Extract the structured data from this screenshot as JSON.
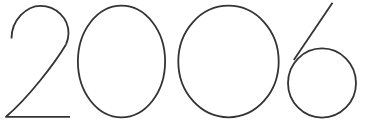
{
  "canvas": {
    "width": 366,
    "height": 127,
    "background_color": "#ffffff"
  },
  "artwork": {
    "name": "year-numerals",
    "text": "2006",
    "style_description": "thin geometric outline numerals",
    "stroke_color": "#333333",
    "stroke_width": 1.8,
    "fill": "none"
  },
  "glyphs": [
    {
      "character": "2",
      "name": "digit-two",
      "bbox": {
        "x": 5,
        "y": 5,
        "width": 65,
        "height": 113
      },
      "parts": [
        {
          "name": "two-top-arc",
          "type": "path",
          "d": "M 11.5 38.5 C 11.5 20.0 26.5 5.8 40.5 5.8 C 56.0 5.8 68.5 18.0 68.5 33.0 C 68.5 39.0 67.2 41.5 66.0 44.5"
        },
        {
          "name": "two-diagonal",
          "type": "path",
          "d": "M 66.0 44.5 C 55.0 63.0 28.0 98.0 6.5 116.2"
        },
        {
          "name": "two-baseline",
          "type": "path",
          "d": "M 5.2 116.8 L 70.0 116.8"
        }
      ]
    },
    {
      "character": "0",
      "name": "digit-zero-first",
      "bbox": {
        "x": 77,
        "y": 5,
        "width": 89,
        "height": 113
      },
      "parts": [
        {
          "name": "zero-first-ellipse",
          "type": "ellipse",
          "cx": 121.5,
          "cy": 61.5,
          "rx": 43.6,
          "ry": 55.8
        }
      ]
    },
    {
      "character": "0",
      "name": "digit-zero-second",
      "bbox": {
        "x": 178,
        "y": 5,
        "width": 101,
        "height": 113
      },
      "parts": [
        {
          "name": "zero-second-ellipse",
          "type": "ellipse",
          "cx": 228.5,
          "cy": 61.5,
          "rx": 50.2,
          "ry": 55.8
        }
      ]
    },
    {
      "character": "6",
      "name": "digit-six",
      "bbox": {
        "x": 288,
        "y": 3,
        "width": 69,
        "height": 115
      },
      "parts": [
        {
          "name": "six-bowl-circle",
          "type": "ellipse",
          "cx": 322.0,
          "cy": 83.0,
          "rx": 34.0,
          "ry": 34.6
        },
        {
          "name": "six-ascender-stroke",
          "type": "path",
          "d": "M 332.5 2.8 L 293.8 60.0"
        }
      ]
    }
  ]
}
